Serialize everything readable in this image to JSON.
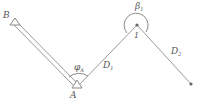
{
  "diagram": {
    "type": "traverse-survey",
    "points": {
      "B": {
        "label": "B",
        "x": 15,
        "y": 20
      },
      "A": {
        "label": "A",
        "x": 77,
        "y": 86
      },
      "P1": {
        "label": "1",
        "x": 137,
        "y": 25
      },
      "P2": {
        "label": "",
        "x": 191,
        "y": 84
      }
    },
    "segments": [
      {
        "from": "B",
        "to": "A",
        "style": "double-line",
        "label": ""
      },
      {
        "from": "A",
        "to": "P1",
        "style": "line",
        "label": "D",
        "subscript": "1"
      },
      {
        "from": "P1",
        "to": "P2",
        "style": "line",
        "label": "D",
        "subscript": "2"
      }
    ],
    "angles": [
      {
        "at": "A",
        "label": "φ",
        "subscript": "A"
      },
      {
        "at": "P1",
        "label": "β",
        "subscript": "1"
      }
    ],
    "colors": {
      "line": "#9a9a9a",
      "text": "#555555",
      "point": "#666666"
    }
  }
}
